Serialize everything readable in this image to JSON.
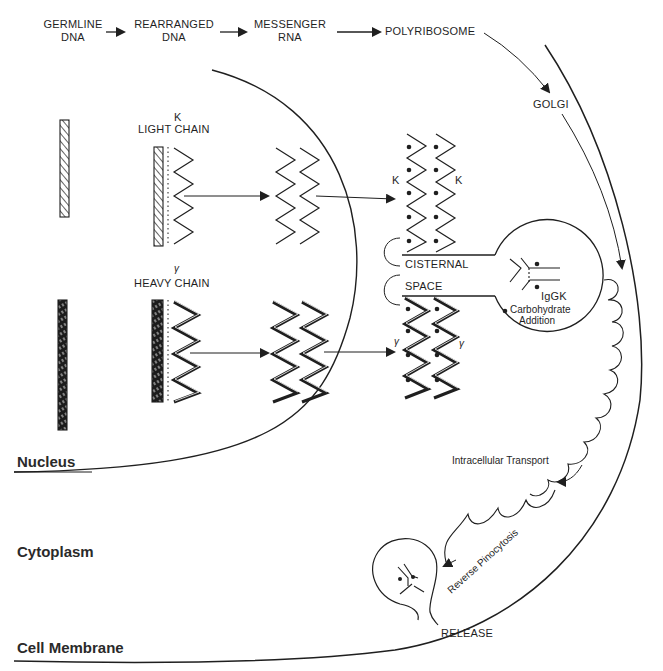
{
  "diagram": {
    "flow": {
      "steps": [
        {
          "line1": "GERMLINE",
          "line2": "DNA"
        },
        {
          "line1": "REARRANGED",
          "line2": "DNA"
        },
        {
          "line1": "MESSENGER",
          "line2": "RNA"
        },
        {
          "line1": "POLYRIBOSOME",
          "line2": ""
        }
      ],
      "golgi": "GOLGI"
    },
    "light_chain": {
      "greek": "K",
      "label": "LIGHT CHAIN",
      "chain_labels": [
        "K",
        "K"
      ]
    },
    "heavy_chain": {
      "greek": "γ",
      "label": "HEAVY CHAIN",
      "chain_labels": [
        "γ",
        "γ"
      ]
    },
    "er": {
      "line1": "CISTERNAL",
      "line2": "SPACE"
    },
    "golgi_vesicle": {
      "antibody": "IgGK",
      "process_line1": "Carbohydrate",
      "process_line2": "Addition"
    },
    "transport": {
      "intracellular": "Intracellular Transport",
      "reverse": "Reverse Pinocytosis",
      "release": "RELEASE"
    },
    "regions": {
      "nucleus": "Nucleus",
      "cytoplasm": "Cytoplasm",
      "membrane": "Cell Membrane"
    },
    "colors": {
      "ink": "#1f1f1f",
      "background": "#ffffff"
    }
  }
}
